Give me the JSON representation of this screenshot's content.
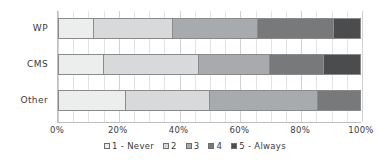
{
  "chart_data": {
    "type": "bar",
    "orientation": "horizontal",
    "stacked": true,
    "normalized": true,
    "title": "",
    "xlabel": "",
    "ylabel": "",
    "xlim": [
      0,
      100
    ],
    "grid": true,
    "legend_position": "bottom",
    "categories": [
      "WP",
      "CMS",
      "Other"
    ],
    "xticks": [
      "0%",
      "20%",
      "40%",
      "60%",
      "80%",
      "100%"
    ],
    "xtick_values": [
      0,
      20,
      40,
      60,
      80,
      100
    ],
    "series": [
      {
        "name": "1 - Never",
        "color": "#eceded",
        "values": [
          11.5,
          14.8,
          22.4
        ]
      },
      {
        "name": "2",
        "color": "#d7d9da",
        "values": [
          26.3,
          31.6,
          27.9
        ]
      },
      {
        "name": "3",
        "color": "#a8abad",
        "values": [
          28.2,
          23.6,
          35.7
        ]
      },
      {
        "name": "4",
        "color": "#77797b",
        "values": [
          25.4,
          18.0,
          14.0
        ]
      },
      {
        "name": "5 - Always",
        "color": "#4a4c4e",
        "values": [
          8.6,
          12.0,
          0.0
        ]
      }
    ]
  },
  "legend": {
    "items": [
      {
        "label": "1 - Never",
        "color": "#eceded"
      },
      {
        "label": "2",
        "color": "#d7d9da"
      },
      {
        "label": "3",
        "color": "#a8abad"
      },
      {
        "label": "4",
        "color": "#77797b"
      },
      {
        "label": "5 - Always",
        "color": "#4a4c4e"
      }
    ]
  }
}
